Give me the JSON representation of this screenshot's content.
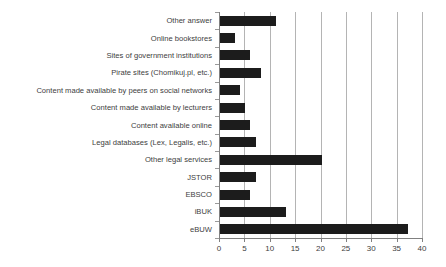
{
  "chart_data": {
    "type": "bar",
    "orientation": "horizontal",
    "title": "",
    "subtitle": "",
    "xlabel": "",
    "ylabel": "",
    "xlim": [
      0,
      40
    ],
    "ylim": null,
    "grid": true,
    "legend": null,
    "legend_position": "none",
    "xticks": [
      0,
      5,
      10,
      15,
      20,
      25,
      30,
      35,
      40
    ],
    "xtick_labels": [
      "0",
      "5",
      "10",
      "15",
      "20",
      "25",
      "30",
      "35",
      "40"
    ],
    "bar_color": "#1c1c1c",
    "gridline_color": "#b4b4b4",
    "axis_color": "#808080",
    "categories": [
      "Other answer",
      "Online bookstores",
      "Sites of government institutions",
      "Pirate sites (Chomikuj.pl, etc.)",
      "Content made available by peers on social networks",
      "Content made available by lecturers",
      "Content available online",
      "Legal databases (Lex, Legalis, etc.)",
      "Other legal services",
      "JSTOR",
      "EBSCO",
      "iBUK",
      "eBUW"
    ],
    "values": [
      11,
      3,
      6,
      8,
      4,
      5,
      6,
      7,
      20,
      7,
      6,
      13,
      37
    ]
  }
}
